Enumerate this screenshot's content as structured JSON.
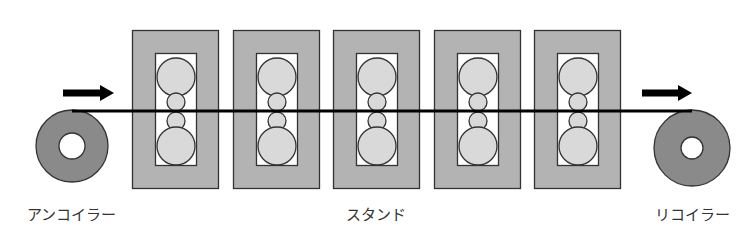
{
  "labels": {
    "uncoiler": "アンコイラー",
    "stand": "スタンド",
    "recoiler": "リコイラー"
  },
  "colors": {
    "stand_housing": "#b3b3b3",
    "stand_window": "#ffffff",
    "roll_fill": "#d9d9d9",
    "coil_fill": "#8a8a8a",
    "outline": "#333333",
    "strip": "#000000",
    "arrow": "#000000"
  },
  "stands": {
    "count": 5,
    "x_positions": [
      132,
      233,
      333,
      434,
      534
    ],
    "width": 86,
    "top": 30,
    "height": 158
  },
  "uncoiler": {
    "cx": 72,
    "cy": 146,
    "r": 36,
    "hole_r": 13
  },
  "recoiler": {
    "cx": 692,
    "cy": 148,
    "r": 38,
    "hole_r": 11
  },
  "strip": {
    "y": 111,
    "x_start": 72,
    "x_end": 692
  },
  "arrows": [
    {
      "name": "entry-direction",
      "x1": 63,
      "x2": 114,
      "y": 93
    },
    {
      "name": "exit-direction",
      "x1": 642,
      "x2": 692,
      "y": 93
    }
  ]
}
